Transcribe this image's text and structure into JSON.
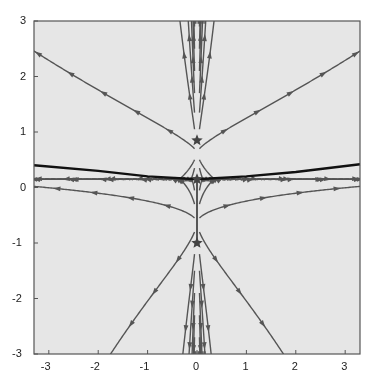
{
  "chart_data": {
    "type": "streamplot",
    "title": "",
    "xlabel": "",
    "ylabel": "",
    "xlim": [
      -3.3,
      3.3
    ],
    "ylim": [
      -3,
      3
    ],
    "xticks": [
      -3,
      -2,
      -1,
      0,
      1,
      2,
      3
    ],
    "yticks": [
      -3,
      -2,
      -1,
      0,
      1,
      2,
      3
    ],
    "xtick_labels": [
      "-3",
      "-2",
      "-1",
      "0",
      "1",
      "2",
      "3"
    ],
    "ytick_labels": [
      "-3",
      "-2",
      "-1",
      "0",
      "1",
      "2",
      "3"
    ],
    "grid": false,
    "background": "#e6e6e6",
    "stream_color": "#555555",
    "fixed_points": [
      {
        "x": 0,
        "y": 0.85,
        "marker": "star"
      },
      {
        "x": 0,
        "y": 0.15,
        "marker": "star"
      },
      {
        "x": 0,
        "y": -1.0,
        "marker": "star"
      }
    ],
    "separatrix": {
      "color": "#111111",
      "points": [
        [
          -3.3,
          0.4
        ],
        [
          -2,
          0.3
        ],
        [
          -1,
          0.2
        ],
        [
          0,
          0.15
        ],
        [
          1,
          0.2
        ],
        [
          2,
          0.28
        ],
        [
          3.3,
          0.42
        ]
      ]
    },
    "vertical_separatrix": {
      "x": 0,
      "y_from": -1.0,
      "y_to": 0.15
    }
  }
}
